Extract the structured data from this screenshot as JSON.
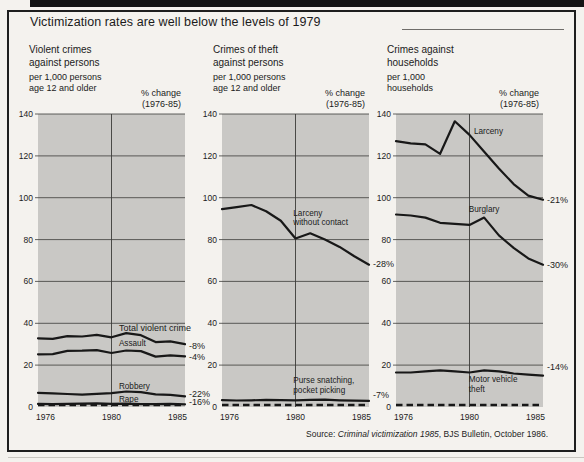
{
  "title": "Victimization rates are well below the levels of 1979",
  "source": {
    "prefix": "Source: ",
    "citation": "Criminal victimization 1985",
    "suffix": ", BJS Bulletin, October 1986."
  },
  "colors": {
    "page_bg": "#f4f2ee",
    "plot_bg": "#c9c8c5",
    "line": "#181818",
    "grid": "#3b3b39",
    "frame": "#1e1e1e"
  },
  "chart_data": [
    {
      "type": "line",
      "title_lines": [
        "Violent crimes",
        "against persons"
      ],
      "unit_lines": [
        "per 1,000 persons",
        "age 12 and older"
      ],
      "pct_header_lines": [
        "% change",
        "(1976-85)"
      ],
      "x_years": [
        1975,
        1976,
        1977,
        1978,
        1979,
        1980,
        1981,
        1982,
        1983,
        1984,
        1985
      ],
      "x_ticks": [
        {
          "year": 1976,
          "label": "1976",
          "align": "start"
        },
        {
          "year": 1980,
          "label": "1980",
          "align": "middle"
        },
        {
          "year": 1985,
          "label": "1985",
          "align": "end"
        }
      ],
      "y_ticks": [
        0,
        20,
        40,
        60,
        80,
        100,
        120,
        140
      ],
      "ylim": [
        0,
        140
      ],
      "vline_year": 1980,
      "zero_line_dashed": true,
      "grid": true,
      "series": [
        {
          "name": "Total violent crime",
          "label_lines": [
            "Total violent crime"
          ],
          "label_year": 1980.5,
          "label_value": 36.5,
          "values": [
            32.8,
            32.6,
            33.9,
            33.7,
            34.5,
            33.3,
            35.3,
            34.3,
            31.0,
            31.4,
            30.0
          ],
          "pct_change": "-8%",
          "pct_label_value": 27.5
        },
        {
          "name": "Assault",
          "label_lines": [
            "Assault"
          ],
          "label_year": 1980.5,
          "label_value": 29.2,
          "values": [
            25.2,
            25.3,
            26.8,
            26.9,
            27.2,
            25.8,
            27.0,
            26.7,
            24.1,
            24.7,
            24.2
          ],
          "pct_change": "-4%",
          "pct_label_value": 22.3
        },
        {
          "name": "Robbery",
          "label_lines": [
            "Robbery"
          ],
          "label_year": 1980.5,
          "label_value": 8.8,
          "values": [
            6.8,
            6.5,
            6.2,
            5.9,
            6.3,
            6.6,
            7.4,
            7.1,
            6.0,
            5.8,
            5.1
          ],
          "pct_change": "-22%",
          "pct_label_value": 4.9
        },
        {
          "name": "Rape",
          "label_lines": [
            "Rape"
          ],
          "label_year": 1980.5,
          "label_value": 2.4,
          "values": [
            1.5,
            1.4,
            1.5,
            1.6,
            1.7,
            1.5,
            1.6,
            1.4,
            1.4,
            1.5,
            1.3
          ],
          "pct_change": "-16%",
          "pct_label_value": 1.0
        }
      ]
    },
    {
      "type": "line",
      "title_lines": [
        "Crimes of theft",
        "against persons"
      ],
      "unit_lines": [
        "per 1,000 persons",
        "age 12 and older"
      ],
      "pct_header_lines": [
        "% change",
        "(1976-85)"
      ],
      "x_years": [
        1975,
        1976,
        1977,
        1978,
        1979,
        1980,
        1981,
        1982,
        1983,
        1984,
        1985
      ],
      "x_ticks": [
        {
          "year": 1976,
          "label": "1976",
          "align": "start"
        },
        {
          "year": 1980,
          "label": "1980",
          "align": "middle"
        },
        {
          "year": 1985,
          "label": "1985",
          "align": "end"
        }
      ],
      "y_ticks": [
        0,
        20,
        40,
        60,
        80,
        100,
        120,
        140
      ],
      "ylim": [
        0,
        140
      ],
      "vline_year": 1980,
      "zero_line_dashed": true,
      "grid": true,
      "series": [
        {
          "name": "Larceny without contact",
          "label_lines": [
            "Larceny",
            "without contact"
          ],
          "label_year": 1979.85,
          "label_value": 91.5,
          "values": [
            94.5,
            95.5,
            96.5,
            93.5,
            89.0,
            80.5,
            83.0,
            80.0,
            76.5,
            72.0,
            68.0
          ],
          "pct_change": "-28%",
          "pct_label_value": 67.0
        },
        {
          "name": "Purse snatching, pocket picking",
          "label_lines": [
            "Purse snatching,",
            "pocket picking"
          ],
          "label_year": 1979.85,
          "label_value": 11.3,
          "values": [
            3.3,
            3.1,
            3.2,
            3.4,
            3.3,
            3.2,
            3.4,
            3.5,
            3.2,
            3.0,
            2.9
          ],
          "pct_change": "-7%",
          "pct_label_value": 4.2
        }
      ]
    },
    {
      "type": "line",
      "title_lines": [
        "Crimes against",
        "households"
      ],
      "unit_lines": [
        "per 1,000",
        "households"
      ],
      "pct_header_lines": [
        "% change",
        "(1976-85)"
      ],
      "x_years": [
        1975,
        1976,
        1977,
        1978,
        1979,
        1980,
        1981,
        1982,
        1983,
        1984,
        1985
      ],
      "x_ticks": [
        {
          "year": 1976,
          "label": "1976",
          "align": "start"
        },
        {
          "year": 1980,
          "label": "1980",
          "align": "middle"
        },
        {
          "year": 1985,
          "label": "1985",
          "align": "end"
        }
      ],
      "y_ticks": [
        0,
        20,
        40,
        60,
        80,
        100,
        120,
        140
      ],
      "ylim": [
        0,
        140
      ],
      "vline_year": 1980,
      "zero_line_dashed": true,
      "grid": true,
      "series": [
        {
          "name": "Larceny",
          "label_lines": [
            "Larceny"
          ],
          "label_year": 1980.3,
          "label_value": 130.5,
          "values": [
            127,
            126,
            125.5,
            121,
            136.5,
            130,
            122,
            114,
            106.5,
            101,
            99
          ],
          "pct_change": "-21%",
          "pct_label_value": 97.5
        },
        {
          "name": "Burglary",
          "label_lines": [
            "Burglary"
          ],
          "label_year": 1979.95,
          "label_value": 93.3,
          "values": [
            92,
            91.5,
            90.5,
            88,
            87.5,
            87,
            90.5,
            82,
            76,
            71,
            68
          ],
          "pct_change": "-30%",
          "pct_label_value": 66.5
        },
        {
          "name": "Motor vehicle theft",
          "label_lines": [
            "Motor vehicle",
            "theft"
          ],
          "label_year": 1979.95,
          "label_value": 11.8,
          "values": [
            16.5,
            16.5,
            17,
            17.5,
            17,
            16.5,
            17.5,
            17,
            16,
            15.5,
            15
          ],
          "pct_change": "-14%",
          "pct_label_value": 17.6
        }
      ]
    }
  ]
}
